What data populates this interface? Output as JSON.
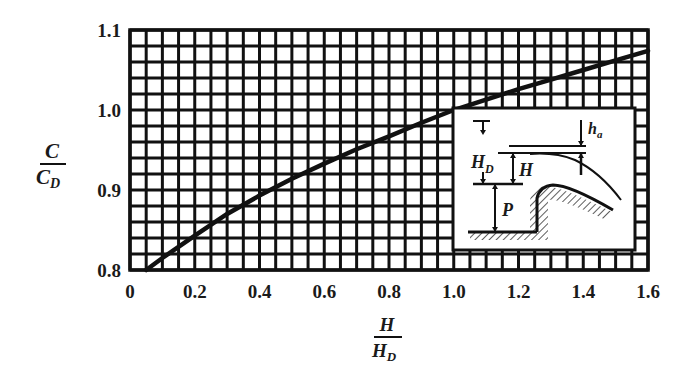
{
  "chart_data": {
    "type": "line",
    "title": "",
    "xlabel": "H / H_D",
    "ylabel": "C / C_D",
    "xlabel_parts": {
      "num": "H",
      "den": "H",
      "den_sub": "D"
    },
    "ylabel_parts": {
      "num": "C",
      "den": "C",
      "den_sub": "D"
    },
    "xlim": [
      0,
      1.6
    ],
    "ylim": [
      0.8,
      1.1
    ],
    "xticks": [
      "0",
      "0.2",
      "0.4",
      "0.6",
      "0.8",
      "1.0",
      "1.2",
      "1.4",
      "1.6"
    ],
    "yticks": [
      "0.8",
      "0.9",
      "1.0",
      "1.1"
    ],
    "grid": true,
    "grid_x_step": 0.05,
    "grid_y_step": 0.02,
    "series": [
      {
        "name": "C/C_D vs H/H_D",
        "x": [
          0.05,
          0.1,
          0.2,
          0.3,
          0.4,
          0.5,
          0.6,
          0.7,
          0.8,
          0.9,
          1.0,
          1.1,
          1.2,
          1.3,
          1.4,
          1.5,
          1.6
        ],
        "y": [
          0.8,
          0.815,
          0.843,
          0.87,
          0.893,
          0.914,
          0.933,
          0.951,
          0.967,
          0.984,
          1.0,
          1.013,
          1.026,
          1.038,
          1.05,
          1.062,
          1.074
        ]
      }
    ],
    "inset": {
      "description": "Ogee spillway crest sketch",
      "labels": {
        "ha": "h",
        "ha_sub": "a",
        "HD": "H",
        "HD_sub": "D",
        "H": "H",
        "P": "P"
      }
    }
  }
}
